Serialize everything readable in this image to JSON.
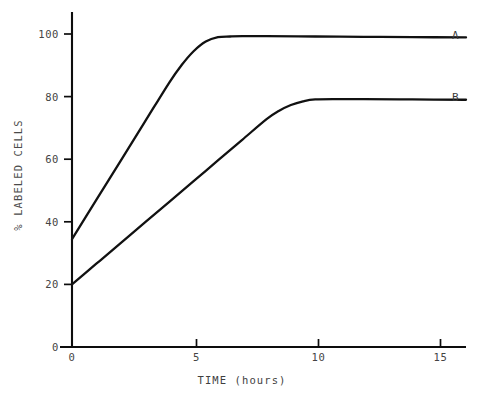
{
  "chart_data": {
    "type": "line",
    "title": "",
    "xlabel": "TIME (hours)",
    "ylabel": "% LABELED CELLS",
    "xlim": [
      0,
      16.2
    ],
    "ylim": [
      0,
      104
    ],
    "grid": false,
    "legend_position": "right-end-of-curve",
    "xticks": [
      0,
      5,
      10,
      15
    ],
    "xtick_labels": [
      "0",
      "5",
      "10",
      "15"
    ],
    "yticks": [
      0,
      20,
      40,
      60,
      80,
      100
    ],
    "ytick_labels": [
      "0",
      "20",
      "40",
      "60",
      "80",
      "100"
    ],
    "series": [
      {
        "name": "A",
        "label": "A",
        "color": "#111111",
        "x": [
          0,
          1,
          2,
          3,
          4,
          4.5,
          5,
          5.5,
          6,
          6.5,
          7,
          8,
          10,
          12,
          14,
          16.2
        ],
        "values": [
          34.5,
          47,
          59.5,
          72,
          84.5,
          90,
          94.5,
          97.6,
          99,
          99.2,
          99.3,
          99.3,
          99.2,
          99.1,
          99.0,
          98.9
        ]
      },
      {
        "name": "B",
        "label": "B",
        "color": "#111111",
        "x": [
          0,
          1,
          2,
          3,
          4,
          5,
          6,
          7,
          8,
          8.5,
          9,
          9.5,
          10,
          11,
          12,
          14,
          16.2
        ],
        "values": [
          20,
          26.6,
          33.2,
          39.8,
          46.4,
          53,
          59.6,
          66.2,
          72.8,
          75.4,
          77.3,
          78.5,
          79.1,
          79.2,
          79.2,
          79.1,
          79.0
        ]
      }
    ],
    "axis_color": "#0d0d0d",
    "background_color": "#ffffff"
  },
  "labels": {
    "y_axis_title": "% LABELED CELLS",
    "x_axis_title": "TIME (hours)",
    "series_a": "A",
    "series_b": "B",
    "y_100": "100",
    "y_80": "80",
    "y_60": "60",
    "y_40": "40",
    "y_20": "20",
    "y_0": "0",
    "x_0": "0",
    "x_5": "5",
    "x_10": "10",
    "x_15": "15"
  }
}
